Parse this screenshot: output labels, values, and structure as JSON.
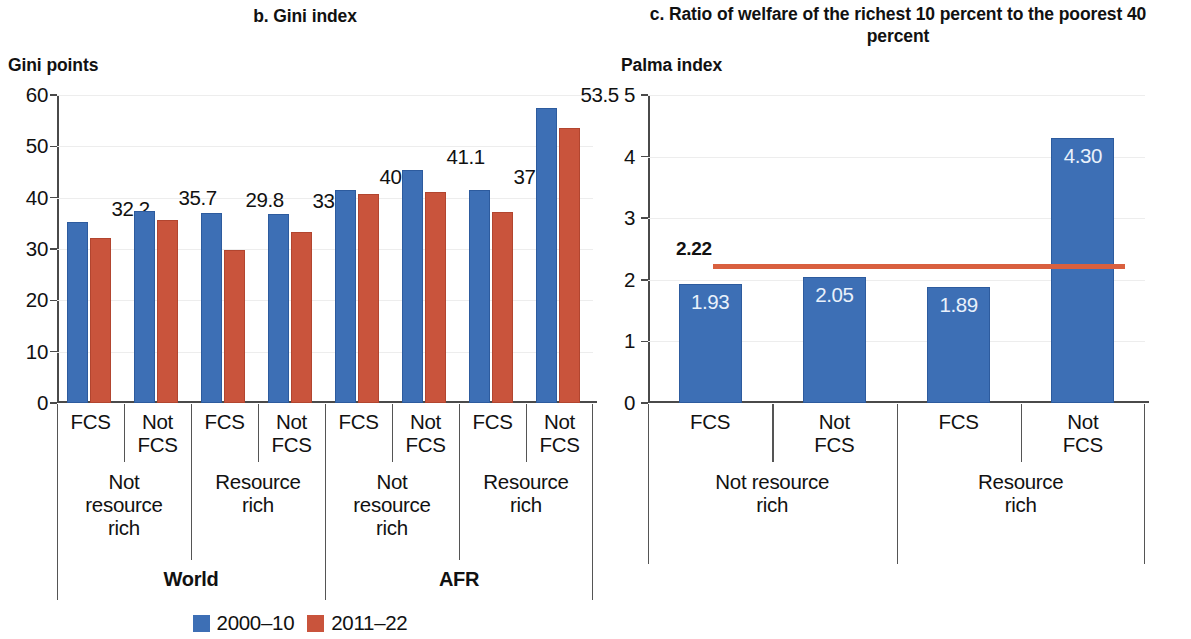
{
  "panel_b": {
    "title": "b. Gini index",
    "axis_unit": "Gini points"
  },
  "panel_c": {
    "title": "c. Ratio of welfare of the richest 10 percent to the poorest 40 percent",
    "axis_unit": "Palma index",
    "reference_label": "2.22"
  },
  "legend": {
    "items": [
      {
        "label": "2000–10",
        "color": "#3D6FB5"
      },
      {
        "label": "2011–22",
        "color": "#C9543C"
      }
    ]
  },
  "axis_labels": {
    "fcs": "FCS",
    "not_fcs": "Not\nFCS",
    "not_resource_rich": "Not\nresource\nrich",
    "resource_rich": "Resource\nrich",
    "not_resource_rich_wide": "Not resource\nrich",
    "resource_rich_wide": "Resource\nrich",
    "world": "World",
    "afr": "AFR"
  },
  "chart_data": [
    {
      "id": "panel_b",
      "type": "bar",
      "title": "b. Gini index",
      "xlabel": "",
      "ylabel": "Gini points",
      "ylim": [
        0,
        60
      ],
      "yticks": [
        0,
        10,
        20,
        30,
        40,
        50,
        60
      ],
      "ytick_labels": [
        "0",
        "10",
        "20",
        "30",
        "40",
        "50",
        "60"
      ],
      "grid": true,
      "legend_position": "bottom-center",
      "categories": [
        "World / Not resource rich / FCS",
        "World / Not resource rich / Not FCS",
        "World / Resource rich / FCS",
        "World / Resource rich / Not FCS",
        "AFR / Not resource rich / FCS",
        "AFR / Not resource rich / Not FCS",
        "AFR / Resource rich / FCS",
        "AFR / Resource rich / Not FCS"
      ],
      "group_levels": {
        "level1": [
          "FCS",
          "Not FCS",
          "FCS",
          "Not FCS",
          "FCS",
          "Not FCS",
          "FCS",
          "Not FCS"
        ],
        "level2": [
          "Not resource rich",
          "Resource rich",
          "Not resource rich",
          "Resource rich"
        ],
        "level3": [
          "World",
          "AFR"
        ]
      },
      "series": [
        {
          "name": "2000–10",
          "color": "#3D6FB5",
          "values": [
            35.2,
            37.5,
            37.0,
            36.8,
            41.5,
            45.3,
            41.4,
            57.5
          ],
          "labels_shown": false
        },
        {
          "name": "2011–22",
          "color": "#C9543C",
          "values": [
            32.2,
            35.7,
            29.8,
            33.4,
            40.7,
            41.1,
            37.3,
            53.5
          ],
          "labels_shown": true,
          "data_labels": [
            "32.2",
            "35.7",
            "29.8",
            "33.4",
            "40.7",
            "41.1",
            "37.3",
            "53.5"
          ]
        }
      ]
    },
    {
      "id": "panel_c",
      "type": "bar",
      "title": "c. Ratio of welfare of the richest 10 percent to the poorest 40 percent",
      "xlabel": "",
      "ylabel": "Palma index",
      "ylim": [
        0,
        5
      ],
      "yticks": [
        0,
        1,
        2,
        3,
        4,
        5
      ],
      "ytick_labels": [
        "0",
        "1",
        "2",
        "3",
        "4",
        "5"
      ],
      "grid": true,
      "legend_position": "none",
      "categories": [
        "Not resource rich / FCS",
        "Not resource rich / Not FCS",
        "Resource rich / FCS",
        "Resource rich / Not FCS"
      ],
      "group_levels": {
        "level1": [
          "FCS",
          "Not FCS",
          "FCS",
          "Not FCS"
        ],
        "level2": [
          "Not resource rich",
          "Resource rich"
        ]
      },
      "series": [
        {
          "name": "Palma index",
          "color": "#3D6FB5",
          "values": [
            1.93,
            2.05,
            1.89,
            4.3
          ],
          "labels_shown": true,
          "data_labels": [
            "1.93",
            "2.05",
            "1.89",
            "4.30"
          ]
        }
      ],
      "reference_line": {
        "value": 2.22,
        "label": "2.22",
        "color": "#D9603F",
        "orientation": "horizontal"
      }
    }
  ]
}
